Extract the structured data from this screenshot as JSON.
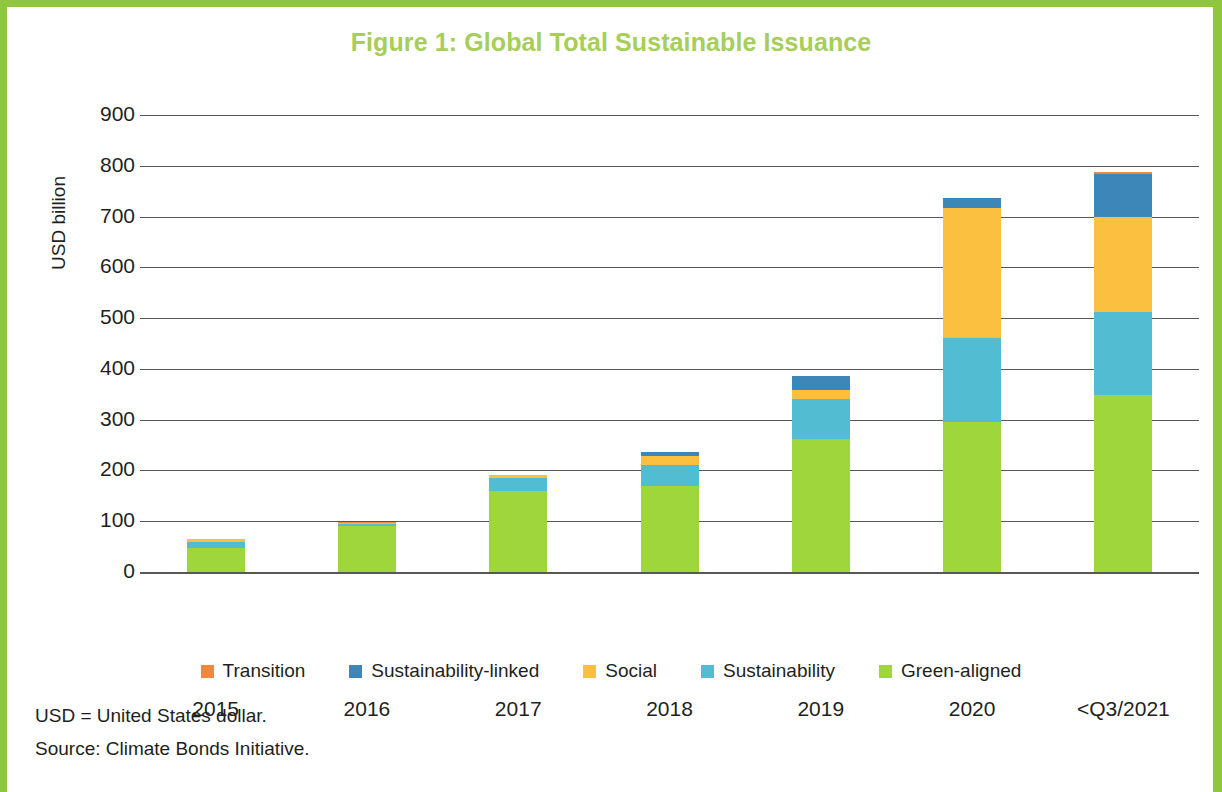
{
  "title": "Figure 1: Global Total Sustainable Issuance",
  "notes": {
    "abbreviation": "USD = United States dollar.",
    "source": "Source: Climate Bonds Initiative."
  },
  "colors": {
    "title": "#a6ce58",
    "frame": "#8fc63d",
    "axis": "#58585b",
    "transition": "#f0883c",
    "sustainability_linked": "#3c87b8",
    "social": "#fbc03f",
    "sustainability": "#52bcd2",
    "green_aligned": "#9ed63c"
  },
  "chart_data": {
    "type": "bar",
    "stacked": true,
    "title": "Figure 1: Global Total Sustainable Issuance",
    "xlabel": "",
    "ylabel": "USD billion",
    "ylim": [
      0,
      900
    ],
    "ytick_step": 100,
    "yticks": [
      "900",
      "800",
      "700",
      "600",
      "500",
      "400",
      "300",
      "200",
      "100",
      "0"
    ],
    "grid": true,
    "legend_position": "bottom",
    "categories": [
      "2015",
      "2016",
      "2017",
      "2018",
      "2019",
      "2020",
      "<Q3/2021"
    ],
    "series": [
      {
        "name": "Green-aligned",
        "color": "#9ed63c",
        "values": [
          48,
          90,
          160,
          170,
          262,
          295,
          348
        ]
      },
      {
        "name": "Sustainability",
        "color": "#52bcd2",
        "values": [
          12,
          4,
          25,
          40,
          78,
          165,
          165
        ]
      },
      {
        "name": "Social",
        "color": "#fbc03f",
        "values": [
          5,
          2,
          6,
          18,
          18,
          257,
          187
        ]
      },
      {
        "name": "Sustainability-linked",
        "color": "#3c87b8",
        "values": [
          0,
          0,
          0,
          8,
          28,
          20,
          83
        ]
      },
      {
        "name": "Transition",
        "color": "#f0883c",
        "values": [
          1,
          2,
          1,
          0,
          0,
          0,
          4
        ]
      }
    ],
    "totals": [
      66,
      98,
      192,
      236,
      386,
      737,
      787
    ]
  },
  "legend": [
    {
      "label": "Transition",
      "color": "#f0883c"
    },
    {
      "label": "Sustainability-linked",
      "color": "#3c87b8"
    },
    {
      "label": "Social",
      "color": "#fbc03f"
    },
    {
      "label": "Sustainability",
      "color": "#52bcd2"
    },
    {
      "label": "Green-aligned",
      "color": "#9ed63c"
    }
  ]
}
